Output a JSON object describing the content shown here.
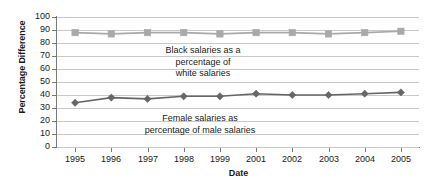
{
  "chart_data": {
    "type": "line",
    "title": "",
    "xlabel": "Date",
    "ylabel": "Percentage Difference",
    "categories": [
      "1995",
      "1996",
      "1997",
      "1998",
      "1999",
      "2001",
      "2002",
      "2003",
      "2004",
      "2005"
    ],
    "ylim": [
      0,
      100
    ],
    "ytick_step": 10,
    "yticks": [
      100,
      90,
      80,
      70,
      60,
      50,
      40,
      30,
      20,
      10,
      0
    ],
    "grid": true,
    "legend_position": "none",
    "series": [
      {
        "name": "Black salaries as a percentage of white salaries",
        "marker": "square",
        "color": "#a9a9a9",
        "values": [
          88,
          87,
          88,
          88,
          87,
          88,
          88,
          87,
          88,
          89
        ]
      },
      {
        "name": "Female salaries as percentage of male salaries",
        "marker": "diamond",
        "color": "#666666",
        "values": [
          34,
          38,
          37,
          39,
          39,
          41,
          40,
          40,
          41,
          42
        ]
      }
    ],
    "annotations": [
      {
        "id": "black",
        "lines": [
          "Black salaries as a",
          "percentage of",
          "white salaries"
        ]
      },
      {
        "id": "female",
        "lines": [
          "Female salaries as",
          "percentage of male salaries"
        ]
      }
    ]
  },
  "axes": {
    "ylabel": "Percentage Difference",
    "xlabel": "Date",
    "ytick_labels": [
      "100",
      "90",
      "80",
      "70",
      "60",
      "50",
      "40",
      "30",
      "20",
      "10",
      "0"
    ],
    "xtick_labels": [
      "1995",
      "1996",
      "1997",
      "1998",
      "1999",
      "2001",
      "2002",
      "2003",
      "2004",
      "2005"
    ]
  },
  "annotations": {
    "black_line1": "Black salaries as a",
    "black_line2": "percentage of",
    "black_line3": "white salaries",
    "female_line1": "Female salaries as",
    "female_line2": "percentage of male salaries"
  },
  "colors": {
    "series_upper": "#a9a9a9",
    "series_lower": "#666666",
    "grid": "#c8c8c8",
    "axis": "#7a7a7a",
    "text": "#1a1a1a"
  }
}
